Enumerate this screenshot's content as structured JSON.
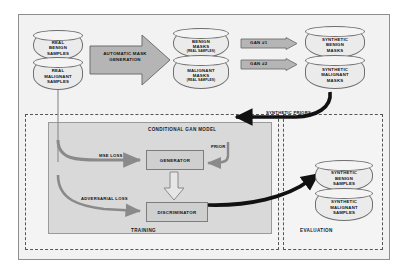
{
  "diagram": {
    "colors": {
      "background": "#f2f2f2",
      "cylinder_fill": "#ebebeb",
      "block_arrow_fill": "#b5b5b5",
      "inner_box_fill": "#cfcfcf",
      "cgan_panel_fill": "#d9d9d9",
      "stroke": "#6f6f6f",
      "thick_arrow": "#1a1a1a"
    },
    "datastores": {
      "real_benign": {
        "line1": "REAL",
        "line2": "BENIGN",
        "line3": "SAMPLES"
      },
      "real_malignant": {
        "line1": "REAL",
        "line2": "MALIGNANT",
        "line3": "SAMPLES"
      },
      "benign_masks": {
        "line1": "BENIGN",
        "line2": "MASKS",
        "sub": "(REAL SAMPLES)"
      },
      "malignant_masks": {
        "line1": "MALIGNANT",
        "line2": "MASKS",
        "sub": "(REAL SAMPLES)"
      },
      "synthetic_benign_masks": {
        "line1": "SYNTHETIC",
        "line2": "BENIGN",
        "line3": "MASKS"
      },
      "synthetic_malignant_masks": {
        "line1": "SYNTHETIC",
        "line2": "MALIGNANT",
        "line3": "MASKS"
      },
      "synthetic_benign_samples": {
        "line1": "SYNTHETIC",
        "line2": "BENIGN",
        "line3": "SAMPLES"
      },
      "synthetic_malignant_samples": {
        "line1": "SYNTHETIC",
        "line2": "MALIGNANT",
        "line3": "SAMPLES"
      }
    },
    "process_arrows": {
      "automatic_mask_generation": {
        "line1": "AUTOMATIC MASK",
        "line2": "GENERATION"
      },
      "gan_1": "GAN #1",
      "gan_2": "GAN #2"
    },
    "panels": {
      "conditional_gan_model": "CONDITIONAL GAN MODEL",
      "training": "TRAINING",
      "evaluation": "EVALUATION"
    },
    "modules": {
      "generator": "GENERATOR",
      "discriminator": "DISCRIMINATOR"
    },
    "edge_labels": {
      "mse_loss": "MSE LOSS",
      "adversarial_loss": "ADVERSARIAL LOSS",
      "prior": "PRIOR",
      "synthetic_priors": "SYNTHETIC PRIORS"
    }
  }
}
